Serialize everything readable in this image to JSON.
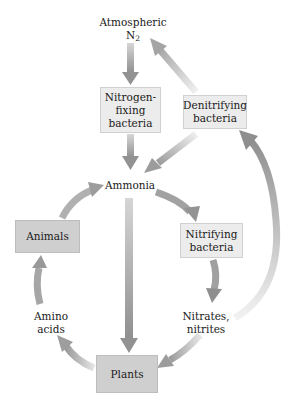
{
  "diagram": {
    "nodes": {
      "atmospheric": {
        "line1": "Atmospheric",
        "line2": "N",
        "sub": "2"
      },
      "nitrogen_fixing": {
        "line1": "Nitrogen-",
        "line2": "fixing",
        "line3": "bacteria"
      },
      "denitrifying": {
        "line1": "Denitrifying",
        "line2": "bacteria"
      },
      "ammonia": {
        "label": "Ammonia"
      },
      "animals": {
        "label": "Animals"
      },
      "nitrifying": {
        "line1": "Nitrifying",
        "line2": "bacteria"
      },
      "amino_acids": {
        "line1": "Amino",
        "line2": "acids"
      },
      "nitrates": {
        "line1": "Nitrates,",
        "line2": "nitrites"
      },
      "plants": {
        "label": "Plants"
      }
    },
    "edges": [
      {
        "from": "Atmospheric N2",
        "to": "Nitrogen-fixing bacteria"
      },
      {
        "from": "Nitrogen-fixing bacteria",
        "to": "Ammonia"
      },
      {
        "from": "Denitrifying bacteria",
        "to": "Atmospheric N2"
      },
      {
        "from": "Denitrifying bacteria",
        "to": "Ammonia"
      },
      {
        "from": "Ammonia",
        "to": "Nitrifying bacteria"
      },
      {
        "from": "Ammonia",
        "to": "Plants"
      },
      {
        "from": "Animals",
        "to": "Ammonia"
      },
      {
        "from": "Nitrifying bacteria",
        "to": "Nitrates, nitrites"
      },
      {
        "from": "Nitrates, nitrites",
        "to": "Plants"
      },
      {
        "from": "Nitrates, nitrites",
        "to": "Denitrifying bacteria"
      },
      {
        "from": "Plants",
        "to": "Amino acids"
      },
      {
        "from": "Amino acids",
        "to": "Animals"
      }
    ],
    "colors": {
      "arrow": "#9a9a9a",
      "arrow_light": "#d8d8d8",
      "box_light": "#ececec",
      "box_dark": "#cfcfcf"
    }
  }
}
